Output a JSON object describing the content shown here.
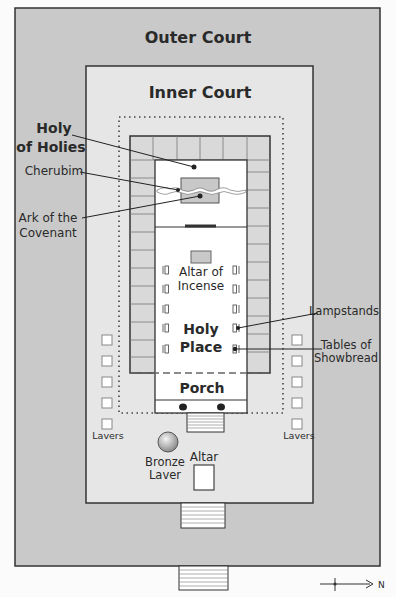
{
  "diagram": {
    "regions": {
      "outer_court": "Outer Court",
      "inner_court": "Inner Court",
      "holy_of_holies": [
        "Holy",
        "of Holies"
      ],
      "holy_place": [
        "Holy",
        "Place"
      ],
      "porch": "Porch"
    },
    "labels": {
      "cherubim": "Cherubim",
      "ark": [
        "Ark of the",
        "Covenant"
      ],
      "altar_of_incense": [
        "Altar of",
        "Incense"
      ],
      "lampstands": "Lampstands",
      "tables": [
        "Tables of",
        "Showbread"
      ],
      "lavers_left": "Lavers",
      "lavers_right": "Lavers",
      "bronze_laver": [
        "Bronze",
        "Laver"
      ],
      "altar": "Altar"
    },
    "compass": {
      "direction": "N"
    },
    "colors": {
      "outer_court_fill": "#c9c9c9",
      "inner_court_fill": "#e6e6e6",
      "side_chambers_fill": "#d9d9d9",
      "sanctuary_fill": "#ffffff",
      "stroke": "#333333",
      "background": "#fbfbfb"
    }
  }
}
